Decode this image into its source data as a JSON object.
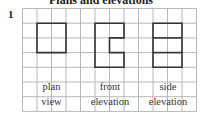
{
  "heading": "Plans and elevations",
  "question_number": "1",
  "grid": {
    "origin_x": 22.5,
    "origin_y": 8.5,
    "cell_w": 14.5,
    "cell_h": 14.7,
    "cols": 12,
    "rows": 7,
    "grid_color": "#b8b8b8",
    "shape_color": "#333333"
  },
  "views": [
    {
      "name": "plan view",
      "label_line1": "plan",
      "label_line2": "view",
      "outline_cells": [
        [
          1,
          1
        ],
        [
          3,
          1
        ],
        [
          3,
          3
        ],
        [
          1,
          3
        ]
      ],
      "inner_lines": [],
      "label_center_col": 2
    },
    {
      "name": "front elevation",
      "label_line1": "front",
      "label_line2": "elevation",
      "outline_cells": [
        [
          5,
          1
        ],
        [
          7,
          1
        ],
        [
          7,
          2
        ],
        [
          6,
          2
        ],
        [
          6,
          3
        ],
        [
          7,
          3
        ],
        [
          7,
          4
        ],
        [
          5,
          4
        ]
      ],
      "inner_lines": [],
      "label_center_col": 6
    },
    {
      "name": "side elevation",
      "label_line1": "side",
      "label_line2": "elevation",
      "outline_cells": [
        [
          9,
          1
        ],
        [
          11,
          1
        ],
        [
          11,
          4
        ],
        [
          9,
          4
        ]
      ],
      "inner_lines": [
        [
          [
            9,
            2
          ],
          [
            11,
            2
          ]
        ],
        [
          [
            9,
            3
          ],
          [
            11,
            3
          ]
        ]
      ],
      "label_center_col": 10
    }
  ],
  "labels": {
    "plan_line1": "plan",
    "plan_line2": "view",
    "front_line1": "front",
    "front_line2": "elevation",
    "side_line1": "side",
    "side_line2": "elevation"
  }
}
